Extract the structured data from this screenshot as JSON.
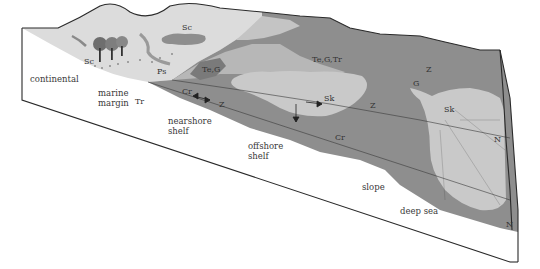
{
  "diagram": {
    "type": "block-diagram",
    "colors": {
      "background": "#ffffff",
      "land_surface": "#dcdcdc",
      "shelf_fill": "#8e8e8e",
      "light_fan": "#c9c9c9",
      "dark_patch": "#7a7a7a",
      "outline": "#2a2a2a"
    },
    "environment_labels": {
      "continental": "continental",
      "marine": "marine",
      "margin": "margin",
      "nearshore": "nearshore",
      "shelf1": "shelf",
      "offshore": "offshore",
      "shelf2": "shelf",
      "slope": "slope",
      "deep_sea": "deep sea"
    },
    "ichnofacies_labels": {
      "sc_land": "Sc",
      "sc_lake": "Sc",
      "ps": "Ps",
      "tr": "Tr",
      "te_g": "Te,G",
      "cr_near": "Cr",
      "z_near": "Z",
      "te_g_tr": "Te,G,Tr",
      "sk_mid": "Sk",
      "z_mid": "Z",
      "cr_mid": "Cr",
      "g_right": "G",
      "z_right": "Z",
      "sk_fan": "Sk",
      "n_upper": "N",
      "n_lower": "N"
    }
  }
}
